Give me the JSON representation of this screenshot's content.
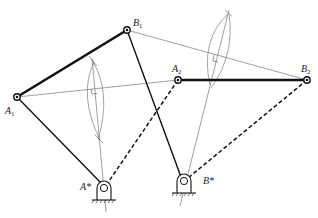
{
  "diagram": {
    "type": "four-bar linkage synthesis (two positions)",
    "points": {
      "A1": {
        "label": "A",
        "sub": "1"
      },
      "B1": {
        "label": "B",
        "sub": "1"
      },
      "A2": {
        "label": "A",
        "sub": "2"
      },
      "B2": {
        "label": "B",
        "sub": "2"
      },
      "Astar": {
        "label": "A*"
      },
      "Bstar": {
        "label": "B*"
      }
    },
    "links": [
      {
        "name": "coupler-position-1",
        "from": "A1",
        "to": "B1",
        "style": "thick-solid"
      },
      {
        "name": "coupler-position-2",
        "from": "A2",
        "to": "B2",
        "style": "thick-solid"
      },
      {
        "name": "crank-A-position-1",
        "from": "Astar",
        "to": "A1",
        "style": "solid"
      },
      {
        "name": "crank-B-position-1",
        "from": "Bstar",
        "to": "B1",
        "style": "solid"
      },
      {
        "name": "crank-A-position-2",
        "from": "Astar",
        "to": "A2",
        "style": "dashed"
      },
      {
        "name": "crank-B-position-2",
        "from": "Bstar",
        "to": "B2",
        "style": "dashed"
      }
    ],
    "construction_lines": [
      {
        "name": "chord-A1-A2",
        "from": "A1",
        "to": "A2"
      },
      {
        "name": "chord-B1-B2",
        "from": "B1",
        "to": "B2"
      },
      {
        "name": "perpendicular-bisector-A"
      },
      {
        "name": "perpendicular-bisector-B"
      }
    ],
    "colors": {
      "ink": "#111111",
      "thin": "#666666"
    }
  }
}
